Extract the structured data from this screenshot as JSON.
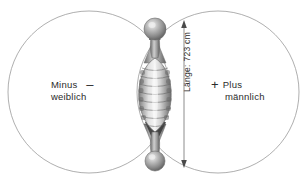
{
  "figure": {
    "title_visible": false,
    "background_color": "#ffffff",
    "line_color": "#8c8c8c",
    "text_color": "#2b2b2b"
  },
  "left_field": {
    "sign": "–",
    "sign_name": "minus-sign",
    "line1": "Minus",
    "line2": "weiblich"
  },
  "right_field": {
    "sign": "+",
    "sign_name": "plus-sign",
    "line1": "Plus",
    "line2": "männlich"
  },
  "dimension": {
    "label": "Länge: 723 cm",
    "value": "723",
    "unit": "cm",
    "prefix": "Länge:",
    "orientation": "vertical",
    "arrow_heads": "both"
  },
  "object": {
    "name": "segmented-spindle-body",
    "bands": 9,
    "end_bulbs": 2
  }
}
